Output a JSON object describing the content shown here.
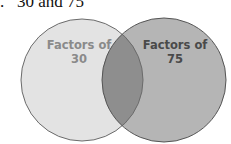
{
  "problem": {
    "number_marker": ".",
    "text": "30 and 75"
  },
  "venn": {
    "sets": [
      {
        "id": "A",
        "label_line1": "Factors of",
        "label_line2": "30",
        "fill": "#e3e3e3",
        "text_color": "#8a8a8a"
      },
      {
        "id": "B",
        "label_line1": "Factors of",
        "label_line2": "75",
        "fill": "#b5b5b5",
        "text_color": "#4a4a4a"
      }
    ],
    "intersection_fill": "#8e8e8e",
    "stroke": "#6b6b6b"
  }
}
